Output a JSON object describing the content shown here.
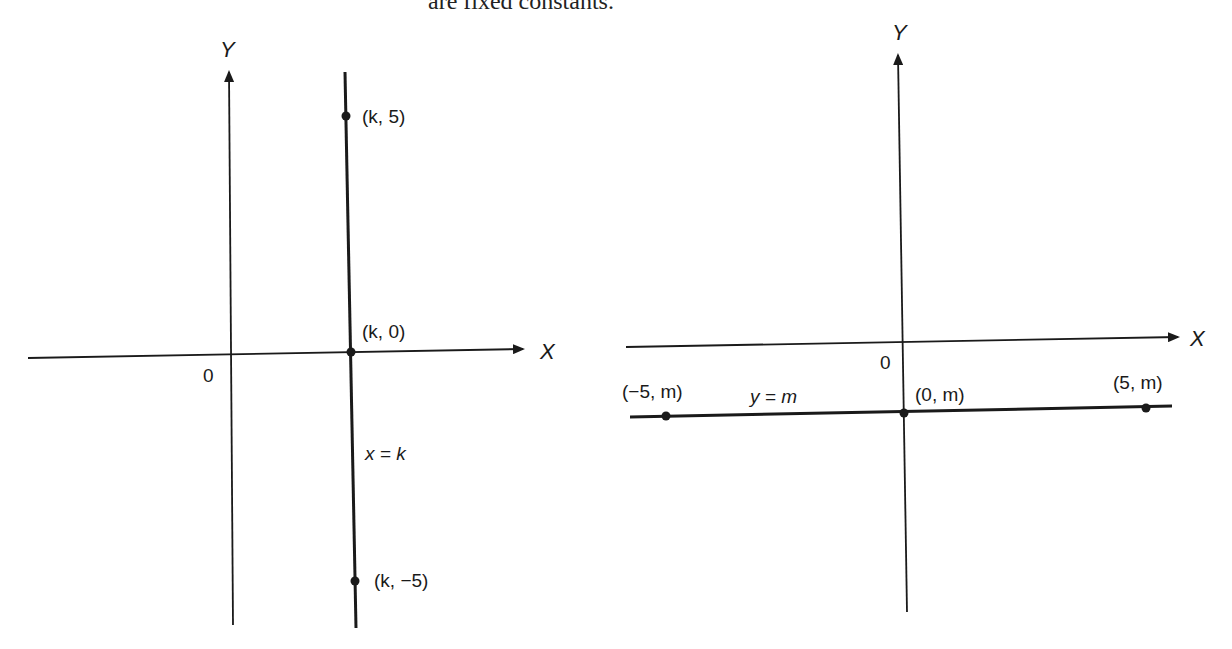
{
  "caption": "are fixed constants.",
  "figures": {
    "left": {
      "y_axis_label": "Y",
      "x_axis_label": "X",
      "origin_label": "0",
      "line_label": "x = k",
      "points": [
        {
          "label": "(k, 5)"
        },
        {
          "label": "(k, 0)"
        },
        {
          "label": "(k, −5)"
        }
      ]
    },
    "right": {
      "y_axis_label": "Y",
      "x_axis_label": "X",
      "origin_label": "0",
      "line_label": "y = m",
      "points": [
        {
          "label": "(−5, m)"
        },
        {
          "label": "(0, m)"
        },
        {
          "label": "(5, m)"
        }
      ]
    }
  },
  "colors": {
    "ink": "#1a1a1a"
  }
}
